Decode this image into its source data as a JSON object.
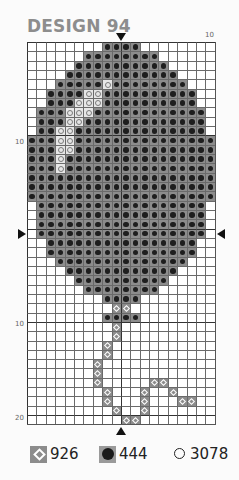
{
  "title": "DESIGN 94",
  "grid": {
    "columns": 20,
    "rows": 41,
    "axis_labels": {
      "top_right": "10",
      "left_upper": "10",
      "left_lower": "10",
      "left_bottom": "20"
    },
    "legend_key": {
      ".": "empty",
      "D": "444",
      "L": "3078",
      "X": "926"
    },
    "pattern": [
      "........DDDD........",
      "......DDDDDDDD......",
      ".....DDDDDDDDDD.....",
      "....DDDDDDDDDDDD....",
      "...DDDDDLDDDDDDDD...",
      "..DDDDLLDDDDDDDDDD..",
      "..DDDLLLDDDDDDDDDD..",
      ".DDDLLLDDDDDDDDDDDD.",
      ".DDDLLDDDDDDDDDDDDD.",
      ".DDLLDDDDDDDDDDDDDD.",
      "DDDLLDDDDDDDDDDDDDDD",
      "DDDLLDDDDDDDDDDDDDDD",
      "DDDLDDDDDDDDDDDDDDDD",
      "DDDLDDDDDDDDDDDDDDDD",
      "DDDDDDDDDDDDDDDDDDDD",
      "DDDDDDDDDDDDDDDDDDDD",
      "DDDDDDDDDDDDDDDDDDDD",
      ".DDDDDDDDDDDDDDDDDD.",
      ".DDDDDDDDDDDDDDDDDD.",
      ".DDDDDDDDDDDDDDDDDD.",
      ".DDDDDDDDDDDDDDDDDD.",
      "..DDDDDDDDDDDDDDDD..",
      "..DDDDDDDDDDDDDDDD..",
      "...DDDDDDDDDDDDDD...",
      "....DDDDDDDDDDDD....",
      ".....DDDDDDDDDD.....",
      "......DDDDDDDD......",
      "........DDDD........",
      ".........XX.........",
      "........DDDD........",
      ".........X..........",
      ".........X..........",
      "........X...........",
      "........X...........",
      ".......X............",
      ".......X............",
      ".......X.....XX.....",
      "........X...X..X....",
      "........X...X...XX..",
      ".........X..X.......",
      "..........XX........"
    ]
  },
  "legend": [
    {
      "symbol": "diamond",
      "code": "926"
    },
    {
      "symbol": "filled-circle",
      "code": "444"
    },
    {
      "symbol": "open-circle",
      "code": "3078"
    }
  ]
}
